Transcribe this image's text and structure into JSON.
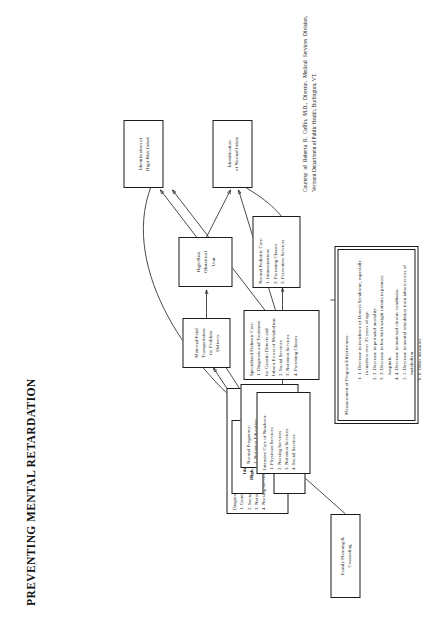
{
  "document": {
    "title": "PREVENTING MENTAL RETARDATION",
    "credit": "Courtesy of Roberta R. Coffin, M.D., Director, Medical Services Division, Vermont Department of Public Health, Burlington, VT."
  },
  "nodes": {
    "family_planning": {
      "label": "Family Planning &\nCounseling"
    },
    "diagnosis_treatment": {
      "heading": "Diagnosis and Treatment Services:",
      "items": [
        "1. Genetic Screening and Counseling",
        "2. Social Services",
        "3. Nutrition Services",
        "4. Nursing Services"
      ]
    },
    "id_high_risk_pregnancy": {
      "label": "Identification of\nHigh-Risk Pregnancy"
    },
    "prenatal_education": {
      "label": "Prenatal\nEducation"
    },
    "normal_pregnancy": {
      "heading": "Normal Pregnancy:",
      "items": [
        "1. Nutrition Education",
        "2. Nursing Services:",
        "Preparation for",
        "Labor & Delivery",
        "3. Prenatal Education"
      ]
    },
    "maternal_fetal_transport": {
      "label": "Maternal/Fetal\nTransportation\nfor Problem\nDelivery"
    },
    "normal_labor_delivery": {
      "label": "Normal Labor\nand Delivery"
    },
    "high_risk_obstetrical_unit": {
      "label": "High-Risk\nObstetrical\nUnit"
    },
    "id_high_risk_infant": {
      "label": "Identification of\nHigh-Risk Infant"
    },
    "id_normal_infant": {
      "label": "Identification\nof Normal Infant"
    },
    "intensive_care_newborn": {
      "heading": "Intensive Care of Newborn:",
      "items": [
        "1. Physician Services",
        "2. Nursing Services",
        "3. Nutrition Services",
        "4. Social Services"
      ]
    },
    "specialized_pediatric_care": {
      "heading": "Specialized Pediatric Care:",
      "items": [
        "1. Diagnosis and Treatment",
        "for Genetic Defects and",
        "Inborn Errors of Metabolism",
        "2. Social Services",
        "3. Nutrition Services",
        "4. Parenting Classes"
      ]
    },
    "normal_pediatric_care": {
      "heading": "Normal Pediatric Care:",
      "items": [
        "1. Immunizations",
        "2. Parenting Classes",
        "3. Preventive Services"
      ]
    },
    "measurement": {
      "heading": "Measurement of Program Effectiveness:",
      "items": [
        "1. Decrease in incidence of Down's Syndrome, especially in mothers over 35 years of age.",
        "2. Decrease in perinatal mortality.",
        "3. Decrease in low birth weight infants in primary hospitals.",
        "4. Decrease in maternal chronic conditions.",
        "5. Decrease in mental retardation from inborn errors of metabolism.",
        "6. Other measures."
      ]
    }
  },
  "colors": {
    "ink": "#1b1b1b",
    "paper": "#ffffff"
  }
}
